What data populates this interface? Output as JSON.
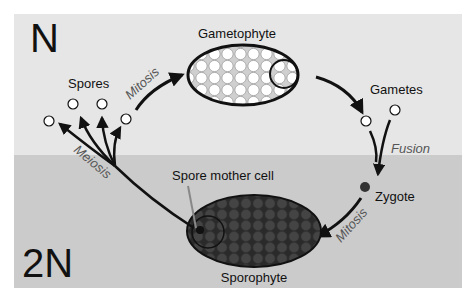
{
  "diagram": {
    "regions": [
      {
        "id": "haploid",
        "label": "N",
        "color": "#e6e6e6"
      },
      {
        "id": "diploid",
        "label": "2N",
        "color": "#cccccc"
      }
    ],
    "nodes": {
      "gametophyte": "Gametophyte",
      "gametes": "Gametes",
      "zygote": "Zygote",
      "sporophyte": "Sporophyte",
      "spore_mother_cell": "Spore mother cell",
      "spores": "Spores"
    },
    "processes": {
      "mitosis_top": "Mitosis",
      "fusion": "Fusion",
      "mitosis_bottom": "Mitosis",
      "meiosis": "Meiosis"
    },
    "colors": {
      "arrow": "#111111",
      "process_text": "#555555",
      "sporophyte_fill": "#3a3a3a",
      "gametophyte_fill": "#ffffff",
      "zygote_fill": "#333333",
      "pointer_line": "#888888"
    }
  }
}
